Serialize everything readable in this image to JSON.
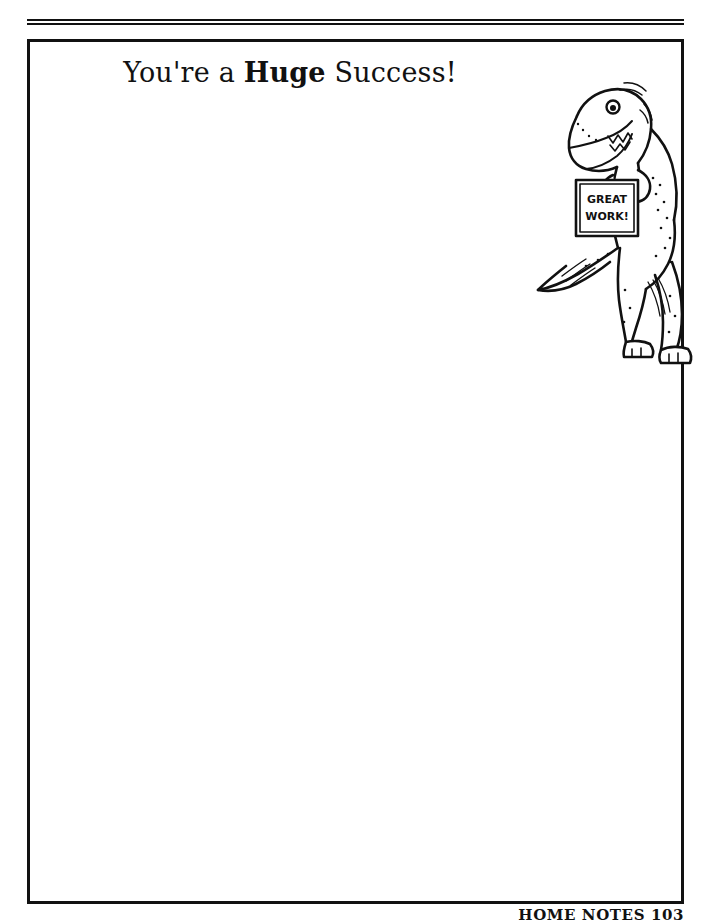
{
  "document": {
    "title": "You're a Huge Success!",
    "heading": {
      "part_before": "You're a ",
      "emphasis": "Huge",
      "part_after": " Success!"
    },
    "footer": "HOME NOTES  103",
    "colors": {
      "ink": "#111111",
      "paper": "#ffffff"
    }
  },
  "artwork": {
    "name": "tyrannosaurus-rex-line-drawing",
    "description": "Smiling cartoon T-Rex standing upright holding a sign",
    "sign": {
      "line1": "GREAT",
      "line2": "WORK!"
    }
  },
  "rules": {
    "top_rule_count": 2
  }
}
